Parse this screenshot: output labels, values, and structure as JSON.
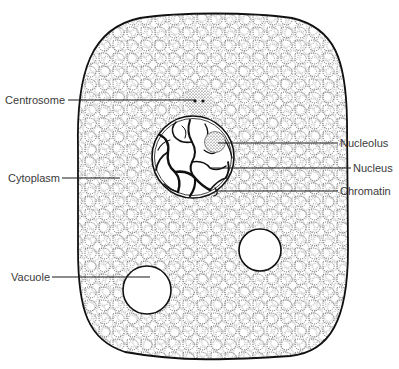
{
  "diagram": {
    "type": "animal cell",
    "labels": {
      "centrosome": "Centrosome",
      "cytoplasm": "Cytoplasm",
      "vacuole": "Vacuole",
      "nucleolus": "Nucleolus",
      "nucleus": "Nucleus",
      "chromatin": "Chromatin"
    },
    "colors": {
      "outline": "#111111",
      "stipple": "#333333",
      "label_text": "#3a3a3a",
      "background": "#ffffff"
    }
  }
}
